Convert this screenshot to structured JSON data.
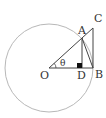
{
  "diagram": {
    "type": "unit-circle-trig",
    "labels": {
      "O": "O",
      "A": "A",
      "B": "B",
      "C": "C",
      "D": "D",
      "angle": "θ"
    },
    "colors": {
      "circle": "#b8b8b8",
      "lines": "#444444",
      "right_angle_marker": "#111111"
    }
  }
}
